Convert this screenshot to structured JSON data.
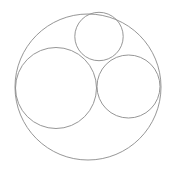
{
  "diagram": {
    "stroke_color": "#8a8a8a",
    "background": "#ffffff",
    "circles": [
      {
        "name": "outer",
        "cx": 88,
        "cy": 87,
        "r": 73
      },
      {
        "name": "left-large",
        "cx": 56,
        "cy": 88,
        "r": 40.5
      },
      {
        "name": "right-medium",
        "cx": 128.5,
        "cy": 86.5,
        "r": 31.5
      },
      {
        "name": "top-small",
        "cx": 99,
        "cy": 36.5,
        "r": 24.2
      }
    ]
  }
}
